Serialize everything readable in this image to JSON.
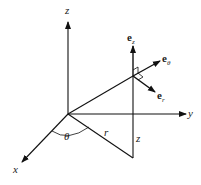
{
  "diagram": {
    "axes": {
      "x": "x",
      "y": "y",
      "z": "z"
    },
    "labels": {
      "theta": "θ",
      "r": "r",
      "height": "z"
    },
    "unit_vectors": [
      {
        "base": "e",
        "sub": "z"
      },
      {
        "base": "e",
        "sub": "θ"
      },
      {
        "base": "e",
        "sub": "r"
      }
    ],
    "colors": {
      "line": "#111111",
      "background": "#ffffff"
    }
  }
}
